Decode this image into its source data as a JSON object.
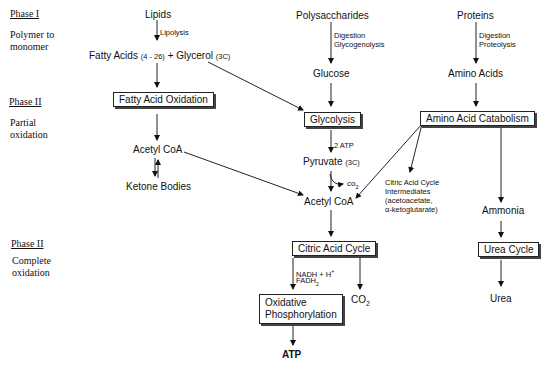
{
  "phases": [
    {
      "label": "Phase I",
      "description": "Polymer to monomer"
    },
    {
      "label": "Phase II",
      "description": "Partial oxidation"
    },
    {
      "label": "Phase II",
      "description": "Complete oxidation"
    }
  ],
  "sources": {
    "lipids": "Lipids",
    "polysaccharides": "Polysaccharides",
    "proteins": "Proteins"
  },
  "process_labels": {
    "lipolysis": "Lipolysis",
    "digestion": "Digestion",
    "glycogenolysis": "Glycogenolysis",
    "proteolysis": "Proteolysis",
    "two_atp": "2 ATP",
    "nadh": "NADH + H",
    "nadh_sup": "+",
    "fadh": "FADH",
    "fadh_sub": "2"
  },
  "monomers": {
    "fatty_acids": "Fatty Acids",
    "fatty_acids_carbons": "(4 - 26)",
    "plus": "+",
    "glycerol": "Glycerol",
    "glycerol_carbons": "(3C)",
    "glucose": "Glucose",
    "amino_acids": "Amino Acids"
  },
  "boxes": {
    "fatty_acid_oxidation": "Fatty Acid Oxidation",
    "glycolysis": "Glycolysis",
    "amino_acid_catabolism": "Amino Acid Catabolism",
    "citric_acid_cycle": "Citric Acid Cycle",
    "urea_cycle": "Urea Cycle",
    "oxidative_line1": "Oxidative",
    "oxidative_line2": "Phosphorylation"
  },
  "intermediates": {
    "acetyl_coa_left": "Acetyl CoA",
    "ketone_bodies": "Ketone Bodies",
    "pyruvate": "Pyruvate",
    "pyruvate_carbons": "(3C)",
    "co2_small": "co",
    "co2_small_sub": "2",
    "acetyl_coa_center": "Acetyl CoA",
    "cac_intermediates_1": "Citric Acid Cycle",
    "cac_intermediates_2": "Intermediates",
    "cac_intermediates_3": "(acetoacetate,",
    "cac_intermediates_4": "α-ketoglutarate)",
    "ammonia": "Ammonia"
  },
  "products": {
    "co2": "CO",
    "co2_sub": "2",
    "atp": "ATP",
    "urea": "Urea"
  }
}
